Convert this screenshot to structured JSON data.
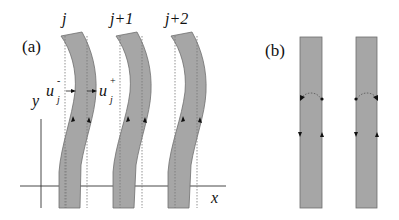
{
  "panel_a": {
    "label": "(a)",
    "strip_labels": [
      "j",
      "j+1",
      "j+2"
    ],
    "u_minus": {
      "base": "u",
      "sub": "j",
      "sup": "-"
    },
    "u_plus": {
      "base": "u",
      "sub": "j",
      "sup": "+"
    },
    "axis_x_label": "x",
    "axis_y_label": "y"
  },
  "panel_b": {
    "label": "(b)"
  },
  "colors": {
    "strip_fill": "#a6a6a6",
    "strip_edge": "#6e6e6e",
    "ink": "#111111"
  }
}
